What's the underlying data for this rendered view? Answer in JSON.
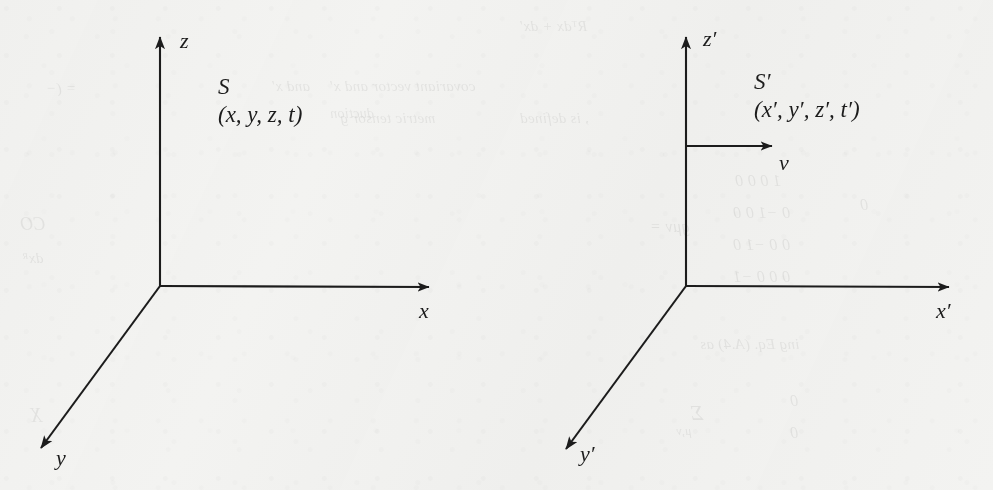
{
  "figure": {
    "type": "coordinate-frame-diagram",
    "background_color": "#f3f3f1",
    "ink_color": "#1c1c1c"
  },
  "frames": [
    {
      "id": "S",
      "name": "S",
      "coords": "(x, y, z, t)",
      "origin": {
        "x": 160,
        "y": 286
      },
      "axes": [
        {
          "name": "z",
          "label": "z",
          "label_x": 180,
          "label_y": 30,
          "tip": {
            "x": 160,
            "y": 25
          }
        },
        {
          "name": "x",
          "label": "x",
          "label_x": 419,
          "label_y": 300,
          "tip": {
            "x": 441,
            "y": 287
          }
        },
        {
          "name": "y",
          "label": "y",
          "label_x": 56,
          "label_y": 447,
          "tip": {
            "x": 31,
            "y": 457
          }
        }
      ]
    },
    {
      "id": "Sprime",
      "name": "S′",
      "coords": "(x′, y′, z′, t′)",
      "origin": {
        "x": 686,
        "y": 286
      },
      "axes": [
        {
          "name": "z-prime",
          "label": "z′",
          "label_x": 703,
          "label_y": 28,
          "tip": {
            "x": 686,
            "y": 25
          }
        },
        {
          "name": "x-prime",
          "label": "x′",
          "label_x": 936,
          "label_y": 300,
          "tip": {
            "x": 961,
            "y": 287
          }
        },
        {
          "name": "y-prime",
          "label": "y′",
          "label_x": 580,
          "label_y": 443,
          "tip": {
            "x": 556,
            "y": 458
          }
        }
      ],
      "velocity_arrow": {
        "label": "v",
        "label_x": 779,
        "label_y": 152,
        "start": {
          "x": 687,
          "y": 146
        },
        "tip": {
          "x": 784,
          "y": 146
        }
      }
    }
  ],
  "showthrough_text": [
    {
      "text": "Rᵀdx + dx′",
      "x": 520,
      "y": 18,
      "size": 15
    },
    {
      "text": "and x′",
      "x": 272,
      "y": 78,
      "size": 15
    },
    {
      "text": "= (−",
      "x": 46,
      "y": 80,
      "size": 15
    },
    {
      "text": "covariant vector and x′",
      "x": 330,
      "y": 78,
      "size": 15
    },
    {
      "text": "metric tensor g",
      "x": 340,
      "y": 110,
      "size": 15
    },
    {
      "text": ", is defined",
      "x": 520,
      "y": 110,
      "size": 15
    },
    {
      "text": "duction",
      "x": 330,
      "y": 106,
      "size": 14
    },
    {
      "text": "1  0   0   0",
      "x": 735,
      "y": 172,
      "size": 16
    },
    {
      "text": "0 −1  0   0",
      "x": 733,
      "y": 204,
      "size": 16
    },
    {
      "text": "0  0 −1  0",
      "x": 733,
      "y": 236,
      "size": 16
    },
    {
      "text": "0  0   0 −1",
      "x": 733,
      "y": 268,
      "size": 16
    },
    {
      "text": "gμν =",
      "x": 650,
      "y": 218,
      "size": 16
    },
    {
      "text": "ing Eq. (A.4) as",
      "x": 700,
      "y": 336,
      "size": 15
    },
    {
      "text": "Σ",
      "x": 690,
      "y": 400,
      "size": 22
    },
    {
      "text": "μ,ν",
      "x": 676,
      "y": 424,
      "size": 12
    },
    {
      "text": "0",
      "x": 790,
      "y": 392,
      "size": 16
    },
    {
      "text": "0",
      "x": 790,
      "y": 424,
      "size": 16
    },
    {
      "text": "CO",
      "x": 20,
      "y": 214,
      "size": 18
    },
    {
      "text": "dxᴿ",
      "x": 22,
      "y": 250,
      "size": 15
    },
    {
      "text": "X",
      "x": 30,
      "y": 404,
      "size": 20
    },
    {
      "text": "0",
      "x": 860,
      "y": 196,
      "size": 16
    }
  ]
}
